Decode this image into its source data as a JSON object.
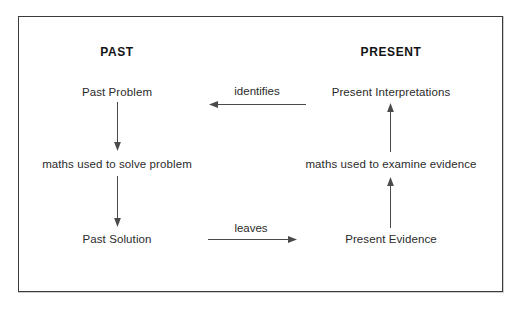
{
  "diagram": {
    "type": "flow-diagram",
    "border_color": "#3b3b3b",
    "text_color": "#2b2b2b",
    "arrow_color": "#4a4a4a",
    "background_color": "#ffffff",
    "columns": [
      {
        "id": "past",
        "heading": "PAST",
        "nodes": [
          {
            "id": "past-problem",
            "label": "Past Problem"
          },
          {
            "id": "past-maths",
            "label": "maths used to solve problem"
          },
          {
            "id": "past-solution",
            "label": "Past Solution"
          }
        ]
      },
      {
        "id": "present",
        "heading": "PRESENT",
        "nodes": [
          {
            "id": "present-interpretations",
            "label": "Present Interpretations"
          },
          {
            "id": "present-maths",
            "label": "maths used to examine evidence"
          },
          {
            "id": "present-evidence",
            "label": "Present Evidence"
          }
        ]
      }
    ],
    "connectors": [
      {
        "id": "past-problem-to-maths",
        "from": "Past Problem",
        "to": "maths used to solve problem",
        "direction": "down",
        "label": ""
      },
      {
        "id": "past-maths-to-solution",
        "from": "maths used to solve problem",
        "to": "Past Solution",
        "direction": "down",
        "label": ""
      },
      {
        "id": "present-maths-to-interpretations",
        "from": "maths used to examine evidence",
        "to": "Present Interpretations",
        "direction": "up",
        "label": ""
      },
      {
        "id": "present-evidence-to-maths",
        "from": "Present Evidence",
        "to": "maths used to examine evidence",
        "direction": "up",
        "label": ""
      },
      {
        "id": "identifies",
        "from": "Present Interpretations",
        "to": "Past Problem",
        "direction": "left",
        "label": "identifies"
      },
      {
        "id": "leaves",
        "from": "Past Solution",
        "to": "Present Evidence",
        "direction": "right",
        "label": "leaves"
      }
    ]
  }
}
